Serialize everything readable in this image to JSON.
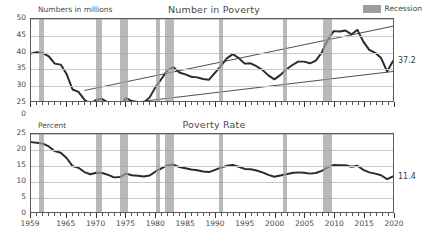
{
  "legend": {
    "label": "Recession",
    "color": "#9e9e9e"
  },
  "panels": {
    "top": {
      "title": "Number in Poverty",
      "axis_note": "Numbers in millions",
      "end_label": "37.2"
    },
    "bottom": {
      "title": "Poverty Rate",
      "axis_note": "Percent",
      "end_label": "11.4"
    }
  },
  "chart_data": [
    {
      "type": "line",
      "title": "Number in Poverty",
      "ylabel": "Numbers in millions",
      "xlabel": "",
      "ylim": [
        25,
        50
      ],
      "y_axis_break": true,
      "yticks": [
        0,
        25,
        30,
        35,
        40,
        45,
        50
      ],
      "xlim": [
        1959,
        2020
      ],
      "xticks": [
        1959,
        1965,
        1970,
        1975,
        1980,
        1985,
        1990,
        1995,
        2000,
        2005,
        2010,
        2015,
        2020
      ],
      "grid": true,
      "legend_position": "top-right",
      "end_value_label": "37.2",
      "x": [
        1959,
        1960,
        1961,
        1962,
        1963,
        1964,
        1965,
        1966,
        1967,
        1968,
        1969,
        1970,
        1971,
        1972,
        1973,
        1974,
        1975,
        1976,
        1977,
        1978,
        1979,
        1980,
        1981,
        1982,
        1983,
        1984,
        1985,
        1986,
        1987,
        1988,
        1989,
        1990,
        1991,
        1992,
        1993,
        1994,
        1995,
        1996,
        1997,
        1998,
        1999,
        2000,
        2001,
        2002,
        2003,
        2004,
        2005,
        2006,
        2007,
        2008,
        2009,
        2010,
        2011,
        2012,
        2013,
        2014,
        2015,
        2016,
        2017,
        2018,
        2019,
        2020
      ],
      "values": [
        39.5,
        39.9,
        39.6,
        38.6,
        36.4,
        36.1,
        33.2,
        28.5,
        27.8,
        25.4,
        24.1,
        25.4,
        25.6,
        24.5,
        23.0,
        23.4,
        25.9,
        25.0,
        24.7,
        24.5,
        26.1,
        29.3,
        31.8,
        34.4,
        35.3,
        33.7,
        33.1,
        32.4,
        32.2,
        31.7,
        31.5,
        33.6,
        35.7,
        38.0,
        39.3,
        38.1,
        36.4,
        36.5,
        35.6,
        34.5,
        32.8,
        31.6,
        32.9,
        34.6,
        35.9,
        37.0,
        37.0,
        36.5,
        37.3,
        39.8,
        43.6,
        46.3,
        46.2,
        46.5,
        45.3,
        46.7,
        43.1,
        40.6,
        39.7,
        38.1,
        34.0,
        37.2
      ],
      "series": [
        {
          "name": "Number in poverty",
          "kind": "data"
        },
        {
          "name": "upper reference line",
          "kind": "trend",
          "x": [
            1968,
            2020
          ],
          "values": [
            28.2,
            47.8
          ]
        },
        {
          "name": "lower reference line",
          "kind": "trend",
          "x": [
            1968,
            2020
          ],
          "values": [
            22.8,
            34.0
          ]
        }
      ],
      "recessions": [
        [
          1960.3,
          1961.1
        ],
        [
          1969.9,
          1970.9
        ],
        [
          1973.9,
          1975.2
        ],
        [
          1980.0,
          1980.6
        ],
        [
          1981.5,
          1982.9
        ],
        [
          1990.5,
          1991.2
        ],
        [
          2001.2,
          2001.9
        ],
        [
          2007.9,
          2009.5
        ],
        [
          2020.1,
          2020.4
        ]
      ]
    },
    {
      "type": "line",
      "title": "Poverty Rate",
      "ylabel": "Percent",
      "xlabel": "",
      "ylim": [
        0,
        25
      ],
      "y_axis_break": false,
      "yticks": [
        0,
        5,
        10,
        15,
        20,
        25
      ],
      "xlim": [
        1959,
        2020
      ],
      "xticks": [
        1959,
        1965,
        1970,
        1975,
        1980,
        1985,
        1990,
        1995,
        2000,
        2005,
        2010,
        2015,
        2020
      ],
      "grid": true,
      "end_value_label": "11.4",
      "x": [
        1959,
        1960,
        1961,
        1962,
        1963,
        1964,
        1965,
        1966,
        1967,
        1968,
        1969,
        1970,
        1971,
        1972,
        1973,
        1974,
        1975,
        1976,
        1977,
        1978,
        1979,
        1980,
        1981,
        1982,
        1983,
        1984,
        1985,
        1986,
        1987,
        1988,
        1989,
        1990,
        1991,
        1992,
        1993,
        1994,
        1995,
        1996,
        1997,
        1998,
        1999,
        2000,
        2001,
        2002,
        2003,
        2004,
        2005,
        2006,
        2007,
        2008,
        2009,
        2010,
        2011,
        2012,
        2013,
        2014,
        2015,
        2016,
        2017,
        2018,
        2019,
        2020
      ],
      "values": [
        22.4,
        22.2,
        21.9,
        21.0,
        19.5,
        19.0,
        17.3,
        14.7,
        14.2,
        12.8,
        12.1,
        12.6,
        12.5,
        11.9,
        11.1,
        11.2,
        12.3,
        11.8,
        11.6,
        11.4,
        11.7,
        13.0,
        14.0,
        15.0,
        15.2,
        14.4,
        14.0,
        13.6,
        13.4,
        13.0,
        12.8,
        13.5,
        14.2,
        14.8,
        15.1,
        14.5,
        13.8,
        13.7,
        13.3,
        12.7,
        11.9,
        11.3,
        11.7,
        12.1,
        12.5,
        12.7,
        12.6,
        12.3,
        12.5,
        13.2,
        14.3,
        15.1,
        15.0,
        15.0,
        14.5,
        14.8,
        13.5,
        12.7,
        12.3,
        11.8,
        10.5,
        11.4
      ],
      "recessions": [
        [
          1960.3,
          1961.1
        ],
        [
          1969.9,
          1970.9
        ],
        [
          1973.9,
          1975.2
        ],
        [
          1980.0,
          1980.6
        ],
        [
          1981.5,
          1982.9
        ],
        [
          1990.5,
          1991.2
        ],
        [
          2001.2,
          2001.9
        ],
        [
          2007.9,
          2009.5
        ],
        [
          2020.1,
          2020.4
        ]
      ]
    }
  ]
}
